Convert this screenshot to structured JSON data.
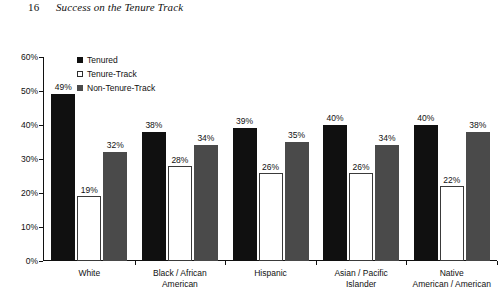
{
  "header": {
    "folio": "16",
    "running_title": "Success on the Tenure Track"
  },
  "legend": {
    "position": "top-left-inside",
    "items": [
      {
        "label": "Tenured",
        "swatch": "filled-black-square-icon",
        "color": "#101010"
      },
      {
        "label": "Tenure-Track",
        "swatch": "outline-white-square-icon",
        "color": "#ffffff"
      },
      {
        "label": "Non-Tenure-Track",
        "swatch": "filled-gray-square-icon",
        "color": "#4a4a4a"
      }
    ]
  },
  "axes": {
    "y_ticks": [
      "0%",
      "10%",
      "20%",
      "30%",
      "40%",
      "50%",
      "60%"
    ],
    "x_categories": [
      {
        "line1": "White",
        "line2": ""
      },
      {
        "line1": "Black / African",
        "line2": "American"
      },
      {
        "line1": "Hispanic",
        "line2": ""
      },
      {
        "line1": "Asian / Pacific",
        "line2": "Islander"
      },
      {
        "line1": "Native",
        "line2": "American / American"
      }
    ]
  },
  "chart_data": {
    "type": "bar",
    "title": "",
    "xlabel": "",
    "ylabel": "",
    "ylim": [
      0,
      60
    ],
    "ytick_step": 10,
    "ytick_format": "percent",
    "grid": false,
    "legend_position": "top-left-inside",
    "categories": [
      "White",
      "Black / African American",
      "Hispanic",
      "Asian / Pacific Islander",
      "Native American / American"
    ],
    "series": [
      {
        "name": "Tenured",
        "color": "#101010",
        "values": [
          49,
          38,
          39,
          40,
          40
        ],
        "labels": [
          "49%",
          "38%",
          "39%",
          "40%",
          "40%"
        ]
      },
      {
        "name": "Tenure-Track",
        "color": "#ffffff",
        "values": [
          19,
          28,
          26,
          26,
          22
        ],
        "labels": [
          "19%",
          "28%",
          "26%",
          "26%",
          "22%"
        ]
      },
      {
        "name": "Non-Tenure-Track",
        "color": "#4a4a4a",
        "values": [
          32,
          34,
          35,
          34,
          38
        ],
        "labels": [
          "32%",
          "34%",
          "35%",
          "34%",
          "38%"
        ]
      }
    ]
  }
}
